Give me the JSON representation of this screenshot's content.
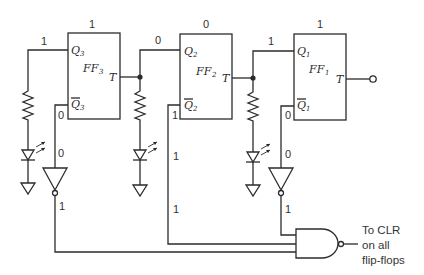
{
  "diagram": {
    "flip_flops": [
      {
        "name": "FF",
        "sub": "3",
        "q": "Q",
        "qbar": "Q",
        "t": "T",
        "state": "1",
        "q_val": "1",
        "qbar_val": "0",
        "inv_in": "0",
        "inv_out": "1"
      },
      {
        "name": "FF",
        "sub": "2",
        "q": "Q",
        "qbar": "Q",
        "t": "T",
        "state": "0",
        "q_val": "0",
        "qbar_val": "1",
        "line_val": "1",
        "bottom_val": "1"
      },
      {
        "name": "FF",
        "sub": "1",
        "q": "Q",
        "qbar": "Q",
        "t": "T",
        "state": "1",
        "q_val": "1",
        "qbar_val": "0",
        "inv_in": "0",
        "inv_out": "1"
      }
    ],
    "output_note": {
      "line1": "To CLR",
      "line2": "on all",
      "line3": "flip-flops"
    },
    "colors": {
      "line": "#2b2b2b",
      "text": "#333333",
      "background": "#ffffff"
    }
  }
}
